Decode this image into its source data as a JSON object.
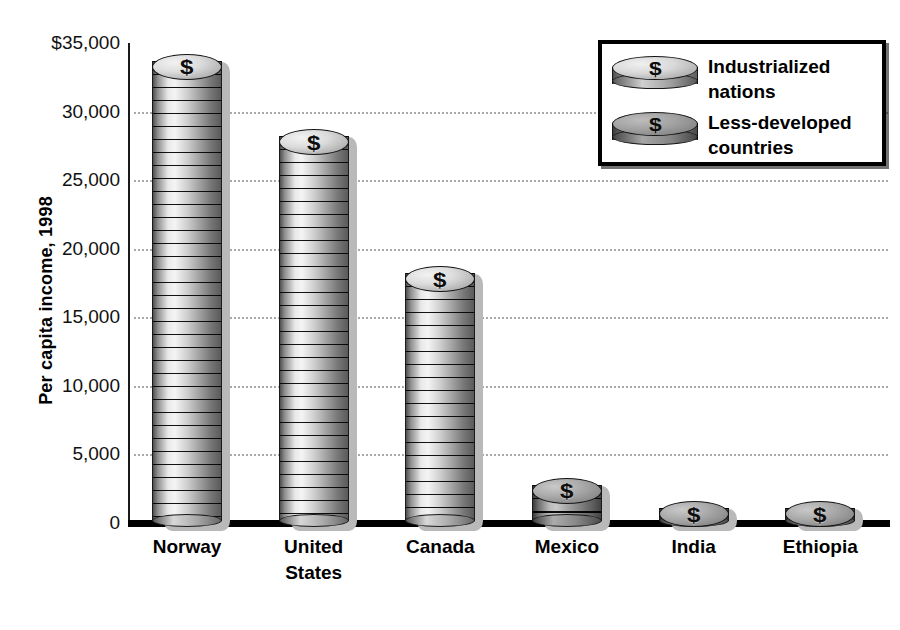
{
  "chart_data": {
    "type": "bar",
    "title": "",
    "subtitle": "",
    "xlabel": "",
    "ylabel": "Per capita income, 1998",
    "categories": [
      "Norway",
      "United States",
      "Canada",
      "Mexico",
      "India",
      "Ethiopia"
    ],
    "values": [
      34500,
      29000,
      19000,
      3600,
      450,
      110
    ],
    "series": [
      {
        "name": "Per capita income, 1998",
        "values": [
          34500,
          29000,
          19000,
          3600,
          450,
          110
        ]
      }
    ],
    "group_of_category": [
      "Industrialized nations",
      "Industrialized nations",
      "Industrialized nations",
      "Less-developed countries",
      "Less-developed countries",
      "Less-developed countries"
    ],
    "ylim": [
      0,
      35000
    ],
    "ytick_values": [
      35000,
      30000,
      25000,
      20000,
      15000,
      10000,
      5000,
      0
    ],
    "ytick_labels": [
      "$35,000",
      "30,000",
      "25,000",
      "20,000",
      "15,000",
      "10,000",
      "5,000",
      "0"
    ],
    "grid": true,
    "grid_axis": "y",
    "grid_style": "dotted",
    "legend_position": "top-right",
    "legend": [
      "Industrialized nations",
      "Less-developed countries"
    ],
    "marker_style": "stacked-coins"
  },
  "axes": {
    "y_title": "Per capita income, 1998",
    "ticks": [
      {
        "label": "$35,000",
        "value": 35000
      },
      {
        "label": "30,000",
        "value": 30000
      },
      {
        "label": "25,000",
        "value": 25000
      },
      {
        "label": "20,000",
        "value": 20000
      },
      {
        "label": "15,000",
        "value": 15000
      },
      {
        "label": "10,000",
        "value": 10000
      },
      {
        "label": "5,000",
        "value": 5000
      },
      {
        "label": "0",
        "value": 0
      }
    ]
  },
  "bars": [
    {
      "name": "Norway",
      "label": "Norway",
      "value": 34500,
      "group": "industrialized"
    },
    {
      "name": "United States",
      "label": "United\nStates",
      "value": 29000,
      "group": "industrialized"
    },
    {
      "name": "Canada",
      "label": "Canada",
      "value": 19000,
      "group": "industrialized"
    },
    {
      "name": "Mexico",
      "label": "Mexico",
      "value": 3600,
      "group": "less-developed"
    },
    {
      "name": "India",
      "label": "India",
      "value": 450,
      "group": "less-developed"
    },
    {
      "name": "Ethiopia",
      "label": "Ethiopia",
      "value": 110,
      "group": "less-developed"
    }
  ],
  "legend": {
    "items": [
      {
        "label": "Industrialized\nnations",
        "group": "industrialized",
        "icon": "coin-light-icon"
      },
      {
        "label": "Less-developed\ncountries",
        "group": "less-developed",
        "icon": "coin-dark-icon"
      }
    ]
  },
  "symbols": {
    "dollar": "$"
  },
  "colors": {
    "background": "#ffffff",
    "axis": "#000000",
    "gridline": "#a9a9a9",
    "coin_light": "#dcdcdc",
    "coin_dark": "#a3a3a3",
    "text": "#000000",
    "shadow": "#b9b9b9"
  }
}
